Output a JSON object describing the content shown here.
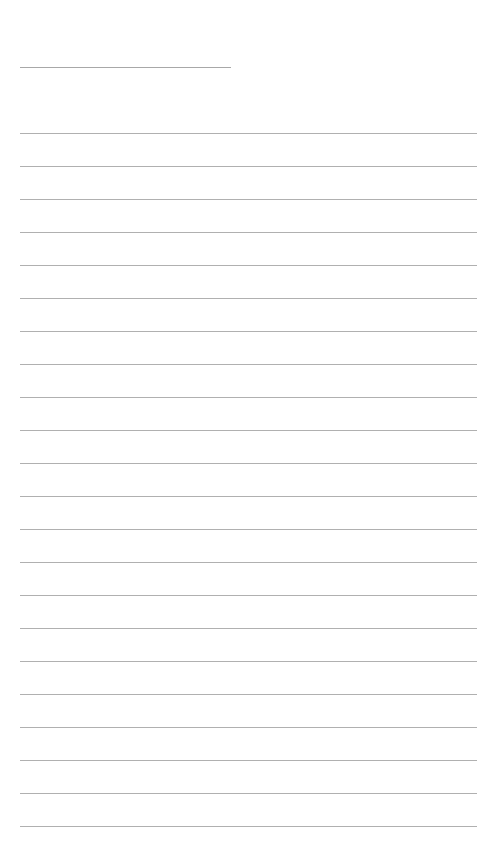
{
  "page": {
    "type": "lined-writing-page",
    "header_line": {
      "present": true
    },
    "ruled_lines_count": 22,
    "line_color": "#b0b0b0",
    "background": "#ffffff"
  }
}
